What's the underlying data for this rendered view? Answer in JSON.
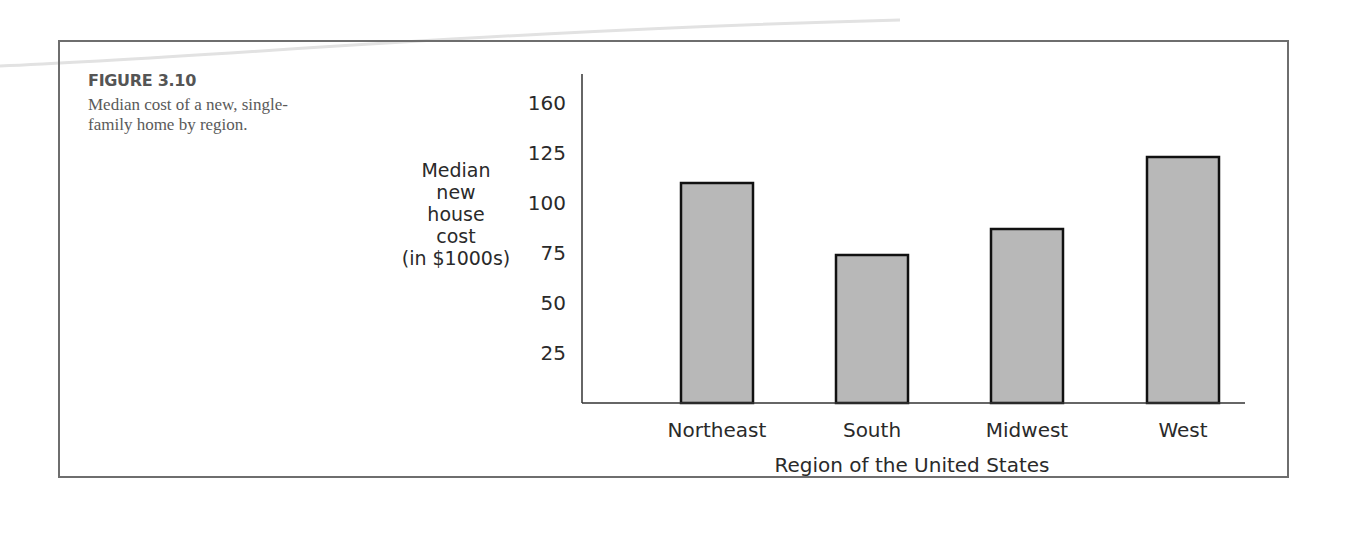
{
  "figure": {
    "label": "FIGURE 3.10",
    "caption": "Median cost of a new, single-family home by region."
  },
  "colors": {
    "bar_fill": "#b8b8b8",
    "bar_stroke": "#111111",
    "axis": "#333333",
    "frame": "#6e6e6e",
    "caption_text": "#5a5a5a"
  },
  "chart_data": {
    "type": "bar",
    "title": "",
    "categories": [
      "Northeast",
      "South",
      "Midwest",
      "West"
    ],
    "values": [
      110,
      74,
      87,
      123
    ],
    "xlabel": "Region of the United States",
    "ylabel_lines": [
      "Median",
      "new",
      "house",
      "cost",
      "(in $1000s)"
    ],
    "ylabel": "Median new house cost (in $1000s)",
    "y_ticks": [
      {
        "label": "25",
        "value": 25
      },
      {
        "label": "50",
        "value": 50
      },
      {
        "label": "75",
        "value": 75
      },
      {
        "label": "100",
        "value": 100
      },
      {
        "label": "125",
        "value": 125
      },
      {
        "label": "160",
        "value": 150,
        "note": "axis break: label 160 drawn where 150 would fall"
      }
    ],
    "ylim": [
      0,
      165
    ],
    "grid": false,
    "legend": "none"
  }
}
